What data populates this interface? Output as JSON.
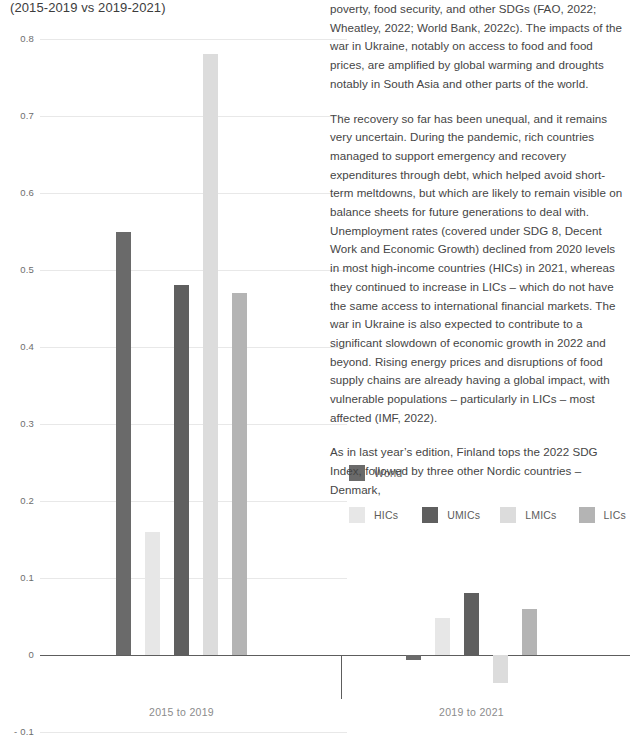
{
  "chart_title": "(2015-2019 vs 2019-2021)",
  "legend": {
    "row1": [
      {
        "label": "World",
        "color": "#6a6a6a"
      }
    ],
    "row2": [
      {
        "label": "HICs",
        "color": "#e7e7e7"
      },
      {
        "label": "UMICs",
        "color": "#5f5f5f"
      },
      {
        "label": "LMICs",
        "color": "#dcdcdc"
      },
      {
        "label": "LICs",
        "color": "#b4b4b4"
      }
    ]
  },
  "chart_data": {
    "type": "bar",
    "title": "(2015-2019 vs 2019-2021)",
    "xlabel": "",
    "ylabel": "",
    "ylim": [
      -0.1,
      0.8
    ],
    "ytick_labels": [
      "0.8",
      "0.7",
      "0.6",
      "0.5",
      "0.4",
      "0.3",
      "0.2",
      "0.1",
      "0",
      "- 0.1"
    ],
    "ytick_values": [
      0.8,
      0.7,
      0.6,
      0.5,
      0.4,
      0.3,
      0.2,
      0.1,
      0,
      -0.1
    ],
    "grid": true,
    "legend_position": "center-right",
    "categories": [
      "2015 to 2019",
      "2019 to 2021"
    ],
    "series": [
      {
        "name": "World",
        "color": "#6a6a6a",
        "values": [
          0.55,
          -0.006
        ]
      },
      {
        "name": "HICs",
        "color": "#e7e7e7",
        "values": [
          0.16,
          0.048
        ]
      },
      {
        "name": "UMICs",
        "color": "#5f5f5f",
        "values": [
          0.48,
          0.08
        ]
      },
      {
        "name": "LMICs",
        "color": "#dcdcdc",
        "values": [
          0.78,
          -0.036
        ]
      },
      {
        "name": "LICs",
        "color": "#b4b4b4",
        "values": [
          0.47,
          0.06
        ]
      }
    ]
  },
  "body_text": {
    "paragraphs": [
      "poverty, food security, and other SDGs (FAO, 2022; Wheatley, 2022; World Bank, 2022c). The impacts of the war in Ukraine, notably on access to food and food prices, are amplified by global warming and droughts notably in South Asia and other parts of the world.",
      "The recovery so far has been unequal, and it remains very uncertain. During the pandemic, rich countries managed to support emergency and recovery expenditures through debt, which helped avoid short-term meltdowns, but which are likely to remain visible on balance sheets for future generations to deal with. Unemployment rates (covered under SDG 8, Decent Work and Economic Growth) declined from 2020 levels in most high-income countries (HICs) in 2021, whereas they continued to increase in LICs – which do not have the same access to international financial markets. The war in Ukraine is also expected to contribute to a significant slowdown of economic growth in 2022 and beyond. Rising energy prices and disruptions of food supply chains are already having a global impact, with vulnerable populations – particularly in LICs – most affected (IMF, 2022).",
      "As in last year’s edition, Finland tops the 2022 SDG Index, followed by three other Nordic countries – Denmark,"
    ]
  }
}
